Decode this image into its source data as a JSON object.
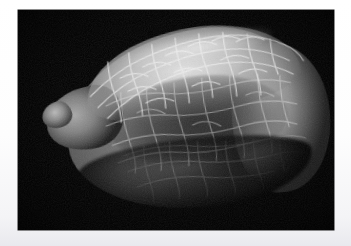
{
  "image": {
    "kind": "sem-micrograph",
    "caption": "",
    "background_color": "#000000",
    "border_color": "#ffffff",
    "frame": {
      "total_width": 351,
      "total_height": 246,
      "field_left": 18,
      "field_top": 10,
      "field_width": 316,
      "field_height": 220
    },
    "subject": {
      "name": "seed-specimen",
      "description": "ovoid seed with reticulate polygonal surface cells",
      "orientation": "tilted, pointed end at left, bulbous end at right"
    },
    "tones": {
      "background": "#000000",
      "dorsal_crest_highlight": "#e2e2e2",
      "mid_surface": "#8b8b8b",
      "lateral_face_shadow": "#4a4a4a",
      "ventral_shadow": "#141414"
    },
    "overlays": {
      "scale_bar_label": "",
      "magnification_label": "",
      "instrument_label": ""
    }
  }
}
